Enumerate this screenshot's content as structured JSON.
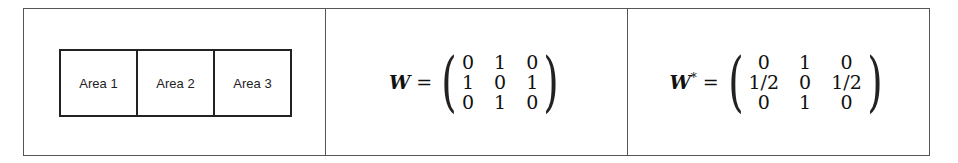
{
  "areas": [
    "Area 1",
    "Area 2",
    "Area 3"
  ],
  "matrix_w": {
    "label": "W",
    "equals": "=",
    "rows": [
      [
        "0",
        "1",
        "0"
      ],
      [
        "1",
        "0",
        "1"
      ],
      [
        "0",
        "1",
        "0"
      ]
    ]
  },
  "matrix_w_star": {
    "label": "W",
    "superscript": "*",
    "equals": "=",
    "rows": [
      [
        "0",
        "1",
        "0"
      ],
      [
        "1/2",
        "0",
        "1/2"
      ],
      [
        "0",
        "1",
        "0"
      ]
    ]
  }
}
